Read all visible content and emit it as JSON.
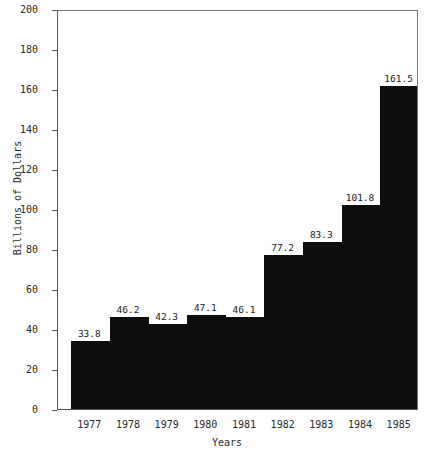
{
  "chart_data": {
    "type": "bar",
    "title": "",
    "subtitle": "",
    "xlabel": "Years",
    "ylabel": "Billions of Dollars",
    "categories": [
      "1977",
      "1978",
      "1979",
      "1980",
      "1981",
      "1982",
      "1983",
      "1984",
      "1985"
    ],
    "values": [
      33.8,
      46.2,
      42.3,
      47.1,
      46.1,
      77.2,
      83.3,
      101.8,
      161.5
    ],
    "data_labels": [
      "33.8",
      "46.2",
      "42.3",
      "47.1",
      "46.1",
      "77.2",
      "83.3",
      "101.8",
      "161.5"
    ],
    "ylim": [
      0,
      200
    ],
    "ytick_labels": [
      "0",
      "20",
      "40",
      "60",
      "80",
      "100",
      "120",
      "140",
      "160",
      "180",
      "200"
    ],
    "ytick_values": [
      0,
      20,
      40,
      60,
      80,
      100,
      120,
      140,
      160,
      180,
      200
    ],
    "xtick_labels": [
      "1977",
      "1978",
      "1979",
      "1980",
      "1981",
      "1982",
      "1983",
      "1984",
      "1985"
    ],
    "grid": false,
    "legend": null,
    "legend_position": "none",
    "bar_color": "#0d0d0d",
    "axis_color": "#555555",
    "background_color": "#ffffff",
    "series": [
      {
        "name": "",
        "values": [
          33.8,
          46.2,
          42.3,
          47.1,
          46.1,
          77.2,
          83.3,
          101.8,
          161.5
        ]
      }
    ]
  }
}
